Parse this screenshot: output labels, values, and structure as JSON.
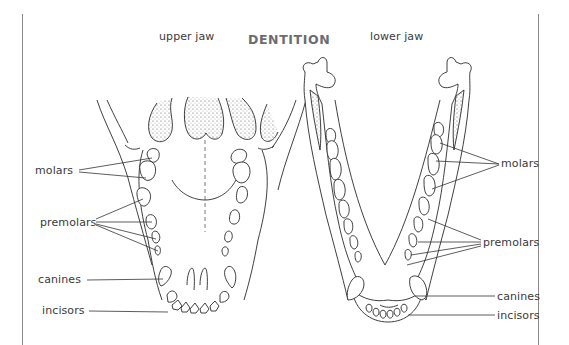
{
  "title": "DENTITION",
  "panels": {
    "upper": {
      "heading": "upper jaw",
      "labels": {
        "molars": "molars",
        "premolars": "premolars",
        "canines": "canines",
        "incisors": "incisors"
      }
    },
    "lower": {
      "heading": "lower jaw",
      "labels": {
        "molars": "molars",
        "premolars": "premolars",
        "canines": "canines",
        "incisors": "incisors"
      }
    }
  },
  "colors": {
    "title": "#6c6c6c",
    "label": "#3a3a3a",
    "line": "#2a2a2a",
    "frame": "#8a8a8a"
  }
}
